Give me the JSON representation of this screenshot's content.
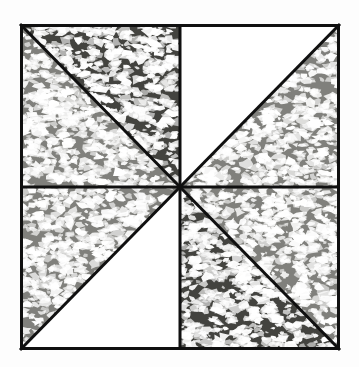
{
  "figure": {
    "canvas_width": 359,
    "canvas_height": 367,
    "background_color": "#fdfdfd"
  },
  "square": {
    "name": "bordered-square",
    "x": 20,
    "y": 24,
    "width": 320,
    "height": 326,
    "center_x": 180,
    "center_y": 187,
    "border_color": "#101010",
    "border_width": 3
  },
  "dividers": {
    "stroke_color": "#101010",
    "stroke_width": 3,
    "lines": [
      {
        "label": "vertical-midline",
        "x1": 180,
        "y1": 24,
        "x2": 180,
        "y2": 350
      },
      {
        "label": "horizontal-midline",
        "x1": 20,
        "y1": 187,
        "x2": 340,
        "y2": 187
      },
      {
        "label": "diagonal-nw-se",
        "x1": 20,
        "y1": 24,
        "x2": 340,
        "y2": 350
      },
      {
        "label": "diagonal-ne-sw",
        "x1": 340,
        "y1": 24,
        "x2": 20,
        "y2": 350
      }
    ]
  },
  "palette": {
    "dark_gray": "#43433f",
    "medium_gray": "#80807c",
    "white": "#ffffff",
    "speckle": "#ffffff",
    "outline": "#101010"
  },
  "sectors": [
    {
      "id": "sector-1",
      "label": "top-left-upper",
      "quadrant": "top-left",
      "position": "upper-right-of-diagonal",
      "fill": "dark_gray",
      "fill_color": "#43433f",
      "texture": "speckled",
      "points": "20,24 180,24 180,187"
    },
    {
      "id": "sector-2",
      "label": "top-left-lower",
      "quadrant": "top-left",
      "position": "lower-left-of-diagonal",
      "fill": "medium_gray",
      "fill_color": "#80807c",
      "texture": "speckled",
      "points": "20,24 180,187 20,187"
    },
    {
      "id": "sector-3",
      "label": "top-right-upper",
      "quadrant": "top-right",
      "position": "upper-left-of-diagonal",
      "fill": "white",
      "fill_color": "#ffffff",
      "texture": "plain",
      "points": "180,24 340,24 180,187"
    },
    {
      "id": "sector-4",
      "label": "top-right-lower",
      "quadrant": "top-right",
      "position": "lower-right-of-diagonal",
      "fill": "medium_gray",
      "fill_color": "#80807c",
      "texture": "speckled",
      "points": "340,24 340,187 180,187"
    },
    {
      "id": "sector-5",
      "label": "bottom-right-upper",
      "quadrant": "bottom-right",
      "position": "upper-right-of-diagonal",
      "fill": "medium_gray",
      "fill_color": "#80807c",
      "texture": "speckled",
      "points": "180,187 340,187 340,350"
    },
    {
      "id": "sector-6",
      "label": "bottom-right-lower",
      "quadrant": "bottom-right",
      "position": "lower-left-of-diagonal",
      "fill": "dark_gray",
      "fill_color": "#43433f",
      "texture": "speckled",
      "points": "180,187 340,350 180,350"
    },
    {
      "id": "sector-7",
      "label": "bottom-left-upper",
      "quadrant": "bottom-left",
      "position": "upper-left-of-diagonal",
      "fill": "medium_gray",
      "fill_color": "#80807c",
      "texture": "speckled",
      "points": "20,187 180,187 20,350"
    },
    {
      "id": "sector-8",
      "label": "bottom-left-lower",
      "quadrant": "bottom-left",
      "position": "lower-right-of-diagonal",
      "fill": "white",
      "fill_color": "#ffffff",
      "texture": "plain",
      "points": "20,350 180,187 180,350"
    }
  ],
  "texture": {
    "description": "irregular white cloud-like speckle blobs scattered over the gray fills",
    "blob_color": "#ffffff",
    "density": "high",
    "seed": 20240517
  }
}
